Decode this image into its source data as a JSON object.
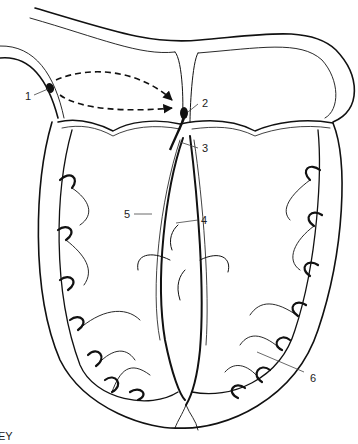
{
  "diagram": {
    "labels": [
      {
        "id": "1",
        "text": "1"
      },
      {
        "id": "2",
        "text": "2"
      },
      {
        "id": "3",
        "text": "3"
      },
      {
        "id": "4",
        "text": "4"
      },
      {
        "id": "5",
        "text": "5"
      },
      {
        "id": "6",
        "text": "6"
      }
    ],
    "key_text": "EY",
    "colors": {
      "line": "#111111",
      "thin_line": "#333333",
      "background": "#ffffff"
    }
  }
}
